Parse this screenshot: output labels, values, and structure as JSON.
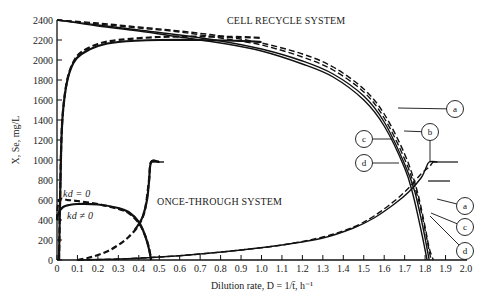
{
  "chart_data": {
    "type": "line",
    "title": "",
    "xlabel": "Dilution rate, D = 1/t̄, h⁻¹",
    "ylabel": "X, Se, mg/L",
    "xlim": [
      0,
      2.0
    ],
    "ylim": [
      0,
      2400
    ],
    "grid": false,
    "x_ticks": [
      "0",
      "0.1",
      "0.2",
      "0.3",
      "0.4",
      "0.5",
      "0.6",
      "0.7",
      "0.8",
      "0.9",
      "1.0",
      "1.1",
      "1.2",
      "1.3",
      "1.4",
      "1.5",
      "1.6",
      "1.7",
      "1.8",
      "1.9",
      "2.0"
    ],
    "y_ticks": [
      "0",
      "200",
      "400",
      "600",
      "800",
      "1000",
      "1200",
      "1400",
      "1600",
      "1800",
      "2000",
      "2200",
      "2400"
    ],
    "annotations": [
      {
        "text": "CELL RECYCLE SYSTEM",
        "x": 0.85,
        "y": 2320
      },
      {
        "text": "ONCE-THROUGH SYSTEM",
        "x": 0.49,
        "y": 560
      },
      {
        "text": "kd = 0",
        "x": 0.05,
        "y": 650
      },
      {
        "text": "kd ≠ 0",
        "x": 0.05,
        "y": 390
      }
    ],
    "series": [
      {
        "name": "Cell recycle X (upper, a, dashed)",
        "style": "dashed",
        "x": [
          0,
          0.2,
          0.4,
          0.6,
          0.8,
          1.0,
          1.2,
          1.35,
          1.5,
          1.6,
          1.7,
          1.76,
          1.8,
          1.82,
          1.84
        ],
        "y": [
          2400,
          2370,
          2330,
          2290,
          2240,
          2170,
          2060,
          1930,
          1710,
          1460,
          1060,
          700,
          330,
          120,
          0
        ]
      },
      {
        "name": "Cell recycle X (b, dashed)",
        "style": "dashed",
        "x": [
          0,
          0.2,
          0.4,
          0.6,
          0.8,
          1.0,
          1.2,
          1.35,
          1.5,
          1.6,
          1.7,
          1.76,
          1.8,
          1.82,
          1.83
        ],
        "y": [
          2400,
          2360,
          2320,
          2280,
          2220,
          2150,
          2030,
          1900,
          1680,
          1420,
          1010,
          660,
          300,
          90,
          0
        ]
      },
      {
        "name": "Cell recycle X (c, solid)",
        "style": "solid",
        "x": [
          0,
          0.2,
          0.4,
          0.6,
          0.8,
          1.0,
          1.2,
          1.35,
          1.5,
          1.6,
          1.7,
          1.75,
          1.79,
          1.81,
          1.82
        ],
        "y": [
          2400,
          2350,
          2300,
          2250,
          2190,
          2110,
          1990,
          1860,
          1640,
          1380,
          960,
          680,
          320,
          110,
          0
        ]
      },
      {
        "name": "Cell recycle X (d, solid)",
        "style": "solid",
        "x": [
          0,
          0.2,
          0.4,
          0.6,
          0.8,
          1.0,
          1.2,
          1.35,
          1.5,
          1.6,
          1.7,
          1.74,
          1.78,
          1.8,
          1.81
        ],
        "y": [
          2400,
          2340,
          2290,
          2230,
          2170,
          2090,
          1960,
          1830,
          1600,
          1340,
          920,
          660,
          300,
          100,
          0
        ]
      },
      {
        "name": "Cell recycle X rising (kd=0, dashed)",
        "style": "dashed",
        "x": [
          0.01,
          0.02,
          0.03,
          0.05,
          0.08,
          0.12,
          0.2,
          0.3,
          0.5,
          0.7,
          0.9,
          1.0
        ],
        "y": [
          0,
          1100,
          1500,
          1800,
          1980,
          2080,
          2160,
          2200,
          2230,
          2235,
          2230,
          2220
        ]
      },
      {
        "name": "Cell recycle X rising (kd≠0, solid)",
        "style": "solid",
        "x": [
          0.01,
          0.02,
          0.03,
          0.05,
          0.08,
          0.12,
          0.2,
          0.3,
          0.5,
          0.7,
          0.9,
          1.0
        ],
        "y": [
          0,
          1100,
          1500,
          1790,
          1970,
          2060,
          2140,
          2180,
          2200,
          2200,
          2190,
          2180
        ]
      },
      {
        "name": "Cell recycle Se (dashed)",
        "style": "dashed",
        "x": [
          0.1,
          0.3,
          0.5,
          0.7,
          0.9,
          1.1,
          1.3,
          1.45,
          1.55,
          1.65,
          1.72,
          1.78,
          1.82,
          1.84,
          1.86
        ],
        "y": [
          0,
          10,
          30,
          60,
          100,
          150,
          230,
          330,
          440,
          590,
          720,
          860,
          930,
          980,
          980
        ]
      },
      {
        "name": "Cell recycle Se (solid)",
        "style": "solid",
        "x": [
          0.1,
          0.3,
          0.5,
          0.7,
          0.9,
          1.1,
          1.3,
          1.45,
          1.55,
          1.65,
          1.72,
          1.78,
          1.8,
          1.82,
          1.86
        ],
        "y": [
          0,
          10,
          30,
          60,
          100,
          150,
          220,
          320,
          420,
          560,
          680,
          820,
          900,
          980,
          980
        ]
      },
      {
        "name": "Once-through X (kd=0, dashed)",
        "style": "dashed",
        "x": [
          0,
          0.01,
          0.05,
          0.1,
          0.2,
          0.3,
          0.35,
          0.4,
          0.43,
          0.45,
          0.46
        ],
        "y": [
          400,
          600,
          600,
          590,
          560,
          510,
          470,
          370,
          250,
          120,
          0
        ]
      },
      {
        "name": "Once-through X (kd≠0, solid)",
        "style": "solid",
        "x": [
          0,
          0.01,
          0.03,
          0.06,
          0.1,
          0.2,
          0.3,
          0.35,
          0.4,
          0.43,
          0.45,
          0.46
        ],
        "y": [
          400,
          480,
          530,
          550,
          560,
          555,
          520,
          480,
          380,
          250,
          110,
          0
        ]
      },
      {
        "name": "Once-through Se (dashed)",
        "style": "dashed",
        "x": [
          0.1,
          0.15,
          0.2,
          0.25,
          0.3,
          0.35,
          0.4,
          0.43,
          0.45,
          0.46,
          0.5
        ],
        "y": [
          0,
          20,
          50,
          90,
          150,
          230,
          350,
          500,
          800,
          980,
          980
        ]
      },
      {
        "name": "Once-through Se (solid)",
        "style": "solid",
        "x": [
          0.38,
          0.4,
          0.42,
          0.44,
          0.45,
          0.46,
          0.5
        ],
        "y": [
          300,
          360,
          440,
          600,
          780,
          980,
          980
        ]
      }
    ],
    "callouts": [
      {
        "label": "a",
        "cx": 455,
        "cy": 109,
        "line_from": [
          398,
          108
        ]
      },
      {
        "label": "b",
        "cx": 430,
        "cy": 132,
        "line_from": [
          404,
          131
        ]
      },
      {
        "label": "c",
        "cx": 364,
        "cy": 139,
        "line_from": [
          393,
          139
        ]
      },
      {
        "label": "d",
        "cx": 364,
        "cy": 163,
        "line_from": [
          399,
          163
        ]
      },
      {
        "label": "a",
        "cx": 465,
        "cy": 206,
        "line_from": [
          437,
          199
        ]
      },
      {
        "label": "c",
        "cx": 465,
        "cy": 227,
        "line_from": [
          431,
          213
        ]
      },
      {
        "label": "d",
        "cx": 465,
        "cy": 251,
        "line_from": [
          430,
          216
        ]
      }
    ]
  }
}
